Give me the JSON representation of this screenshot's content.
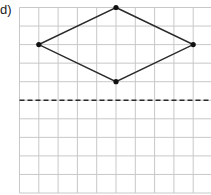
{
  "label": "d)",
  "grid": {
    "origin_x": 19.5,
    "origin_y": 7.5,
    "cell_w": 19.3,
    "cell_h": 18.55,
    "cols": 10,
    "rows": 10,
    "line_color": "#c8c8c8"
  },
  "shape": {
    "type": "rhombus",
    "stroke": "#2a2a2a",
    "vertices": [
      {
        "name": "top",
        "col": 5,
        "row": 0
      },
      {
        "name": "right",
        "col": 9,
        "row": 2
      },
      {
        "name": "bottom",
        "col": 5,
        "row": 4
      },
      {
        "name": "left",
        "col": 1,
        "row": 2
      }
    ]
  },
  "mirror_line": {
    "style": "dashed",
    "row": 5,
    "color": "#2a2a2a"
  }
}
